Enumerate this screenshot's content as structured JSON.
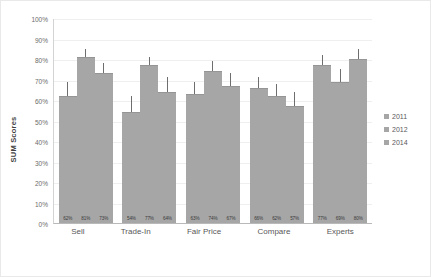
{
  "chart_data": {
    "type": "bar",
    "title": "",
    "subtitle": "",
    "xlabel": "",
    "ylabel": "SUM Scores",
    "ylim": [
      0,
      100
    ],
    "yticks": [
      "0%",
      "10%",
      "20%",
      "30%",
      "40%",
      "50%",
      "60%",
      "70%",
      "80%",
      "90%",
      "100%"
    ],
    "ytick_values": [
      0,
      10,
      20,
      30,
      40,
      50,
      60,
      70,
      80,
      90,
      100
    ],
    "grid": true,
    "legend_position": "right",
    "categories": [
      "Sell",
      "Trade-In",
      "Fair Price",
      "Compare",
      "Experts"
    ],
    "series": [
      {
        "name": "2011",
        "color": "#a6a6a6",
        "values": [
          62,
          54,
          63,
          66,
          77
        ],
        "labels": [
          "62%",
          "54%",
          "63%",
          "66%",
          "77%"
        ],
        "error_low": [
          55,
          47,
          57,
          60,
          72
        ],
        "error_high": [
          69,
          62,
          69,
          71,
          82
        ]
      },
      {
        "name": "2012",
        "color": "#a6a6a6",
        "values": [
          81,
          77,
          74,
          62,
          69
        ],
        "labels": [
          "81%",
          "77%",
          "74%",
          "62%",
          "69%"
        ],
        "error_low": [
          76,
          72,
          69,
          57,
          64
        ],
        "error_high": [
          85,
          81,
          79,
          68,
          75
        ]
      },
      {
        "name": "2014",
        "color": "#a6a6a6",
        "values": [
          73,
          64,
          67,
          57,
          80
        ],
        "labels": [
          "73%",
          "64%",
          "67%",
          "57%",
          "80%"
        ],
        "error_low": [
          67,
          57,
          61,
          51,
          75
        ],
        "error_high": [
          78,
          71,
          73,
          64,
          85
        ]
      }
    ]
  },
  "legend": {
    "items": [
      {
        "label": "2011"
      },
      {
        "label": "2012"
      },
      {
        "label": "2014"
      }
    ]
  },
  "colors": {
    "bar": "#a6a6a6",
    "error": "#6e6e6e",
    "grid": "#efefef",
    "axis": "#b9b9b9",
    "text": "#5a5a5a"
  }
}
